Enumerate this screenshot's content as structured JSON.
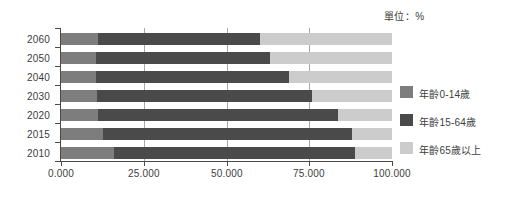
{
  "unit_caption": "單位：%",
  "axis": {
    "x_ticks": [
      "0.000",
      "25.000",
      "50.000",
      "75.000",
      "100.000"
    ],
    "x_tick_values": [
      0,
      25,
      50,
      75,
      100
    ],
    "categories": [
      "2060",
      "2050",
      "2040",
      "2030",
      "2020",
      "2015",
      "2010"
    ]
  },
  "legend": {
    "items": [
      {
        "label": "年齡0-14歲",
        "color": "#7d7d7d",
        "name": "legend-item-age-0-14"
      },
      {
        "label": "年齡15-64歲",
        "color": "#4a4a4a",
        "name": "legend-item-age-15-64"
      },
      {
        "label": "年齡65歲以上",
        "color": "#cccccc",
        "name": "legend-item-age-65-plus"
      }
    ]
  },
  "colors": {
    "age_0_14": "#7d7d7d",
    "age_15_64": "#4a4a4a",
    "age_65_plus": "#cccccc",
    "axis": "#4a4a4a",
    "gridline": "#a9a9a9",
    "background": "#ffffff",
    "text": "#3d3d3d"
  },
  "chart_data": {
    "type": "bar",
    "orientation": "horizontal",
    "stacked": true,
    "title": "",
    "subtitle": "",
    "annotations": [
      "單位：%"
    ],
    "xlabel": "",
    "ylabel": "",
    "xlim": [
      0,
      100
    ],
    "grid": true,
    "legend_position": "right",
    "categories": [
      "2060",
      "2050",
      "2040",
      "2030",
      "2020",
      "2015",
      "2010"
    ],
    "series": [
      {
        "name": "年齡0-14歲",
        "color": "#7d7d7d",
        "values": [
          11.2,
          10.6,
          10.6,
          11.0,
          11.2,
          12.7,
          16.0
        ]
      },
      {
        "name": "年齡15-64歲",
        "color": "#4a4a4a",
        "values": [
          48.9,
          52.4,
          58.4,
          64.8,
          72.5,
          75.3,
          72.8
        ]
      },
      {
        "name": "年齡65歲以上",
        "color": "#cccccc",
        "values": [
          39.9,
          37.0,
          31.0,
          24.2,
          16.3,
          12.0,
          11.2
        ]
      }
    ]
  }
}
